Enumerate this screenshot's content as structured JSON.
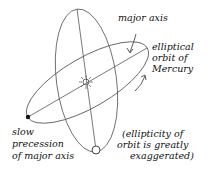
{
  "diagram": {
    "labels": {
      "major_axis": "major axis",
      "orbit_line1": "elliptical",
      "orbit_line2": "orbit of",
      "orbit_line3": "Mercury",
      "precession_line1": "slow",
      "precession_line2": "precession",
      "precession_line3": "of major axis",
      "note_line1": "(ellipticity of",
      "note_line2": "orbit is greatly",
      "note_line3": "exaggerated)"
    },
    "elements": {
      "sun": "sun-icon",
      "mercury_perihelion_old": "filled-dot",
      "mercury_position_new": "open-circle"
    },
    "colors": {
      "line": "#444444",
      "text": "#111111",
      "background": "#ffffff"
    }
  }
}
